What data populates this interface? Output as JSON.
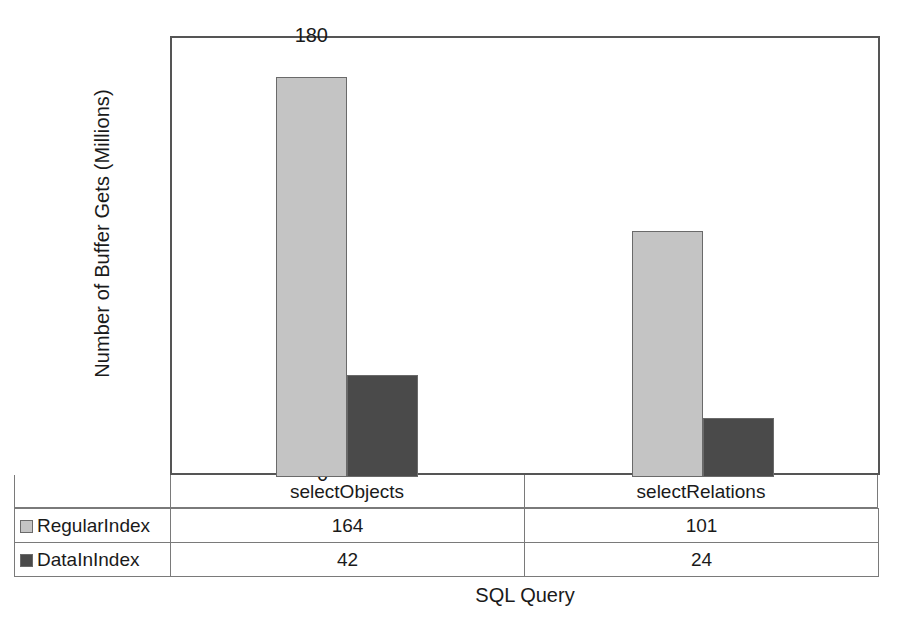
{
  "chart_data": {
    "type": "bar",
    "title": "",
    "xlabel": "SQL Query",
    "ylabel": "Number of Buffer Gets (Millions)",
    "categories": [
      "selectObjects",
      "selectRelations"
    ],
    "series": [
      {
        "name": "RegularIndex",
        "values": [
          164,
          101
        ],
        "color": "#c4c4c4"
      },
      {
        "name": "DataInIndex",
        "values": [
          42,
          24
        ],
        "color": "#4a4a4a"
      }
    ],
    "ylim": [
      0,
      180
    ],
    "yticks": [
      0,
      20,
      40,
      60,
      80,
      100,
      120,
      140,
      160,
      180
    ],
    "ytick_labels": [
      "0",
      "20",
      "40",
      "60",
      "80",
      "100",
      "120",
      "140",
      "160",
      "180"
    ],
    "grid": false,
    "legend_position": "data-table-left",
    "data_table": {
      "rows": [
        {
          "label": "RegularIndex",
          "swatch": "light-gray-swatch-icon",
          "cells": [
            "164",
            "101"
          ]
        },
        {
          "label": "DataInIndex",
          "swatch": "dark-gray-swatch-icon",
          "cells": [
            "42",
            "24"
          ]
        }
      ]
    }
  }
}
